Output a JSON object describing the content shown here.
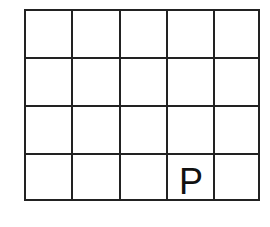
{
  "grid": {
    "rows": 4,
    "cols": 5,
    "line_color": "#222222"
  },
  "labels": [
    {
      "row": 3,
      "col": 3,
      "text": "P"
    }
  ]
}
